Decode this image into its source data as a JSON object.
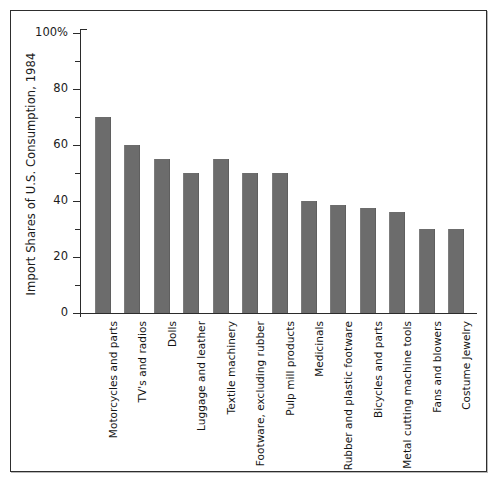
{
  "chart_data": {
    "type": "bar",
    "title": "",
    "xlabel": "",
    "ylabel": "Import Shares of U.S. Consumption, 1984",
    "ylim": [
      0,
      100
    ],
    "grid": false,
    "legend": null,
    "y_ticks_major": [
      "0",
      "20",
      "40",
      "60",
      "80",
      "100%"
    ],
    "y_tick_values_major": [
      0,
      20,
      40,
      60,
      80,
      100
    ],
    "y_tick_values_minor": [
      10,
      30,
      50,
      70,
      90
    ],
    "categories": [
      "Motorcycles and parts",
      "TV's and radios",
      "Dolls",
      "Luggage and leather",
      "Textile machinery",
      "Footware, excluding rubber",
      "Pulp mill products",
      "Medicinals",
      "Rubber and plastic footware",
      "Bicycles and parts",
      "Metal cutting machine tools",
      "Fans and blowers",
      "Costume Jewelry"
    ],
    "values": [
      70,
      60,
      55,
      50,
      55,
      50,
      50,
      40,
      38.5,
      37.5,
      36,
      30,
      30
    ],
    "bar_color": "#6c6c6c",
    "axis_color": "#2b2b2b",
    "background_color": "#ffffff"
  }
}
